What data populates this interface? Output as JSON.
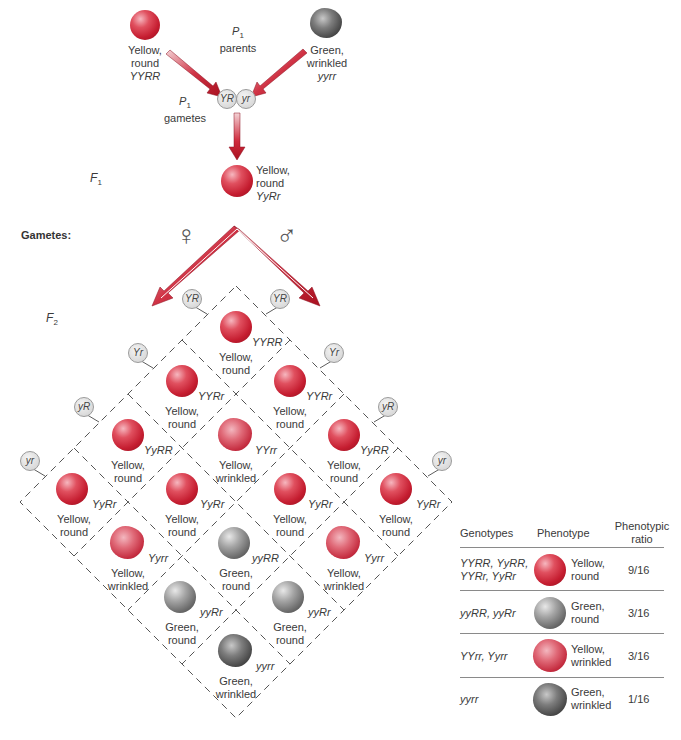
{
  "p1": {
    "title_main": "P",
    "title_sub": "1",
    "title_word": "parents",
    "left_parent": {
      "phenotype_line1": "Yellow,",
      "phenotype_line2": "round",
      "genotype": "YYRR",
      "pea": "yellow-round"
    },
    "right_parent": {
      "phenotype_line1": "Green,",
      "phenotype_line2": "wrinkled",
      "genotype": "yyrr",
      "pea": "green-wrinkled"
    },
    "gametes_label_main": "P",
    "gametes_label_sub": "1",
    "gametes_label_word": "gametes",
    "gametes": [
      "YR",
      "yr"
    ]
  },
  "f1": {
    "label_main": "F",
    "label_sub": "1",
    "phenotype_line1": "Yellow,",
    "phenotype_line2": "round",
    "genotype": "YyRr"
  },
  "gametes_section": {
    "label": "Gametes:",
    "female_symbol": "♀",
    "male_symbol": "♂"
  },
  "f2": {
    "label_main": "F",
    "label_sub": "2",
    "female_gametes": [
      "YR",
      "Yr",
      "yR",
      "yr"
    ],
    "male_gametes": [
      "YR",
      "Yr",
      "yR",
      "yr"
    ],
    "cells": [
      {
        "f": 0,
        "m": 0,
        "genotype": "YYRR",
        "line1": "Yellow,",
        "line2": "round",
        "pea": "yr"
      },
      {
        "f": 1,
        "m": 0,
        "genotype": "YYRr",
        "line1": "Yellow,",
        "line2": "round",
        "pea": "yr"
      },
      {
        "f": 0,
        "m": 1,
        "genotype": "YYRr",
        "line1": "Yellow,",
        "line2": "round",
        "pea": "yr"
      },
      {
        "f": 2,
        "m": 0,
        "genotype": "YyRR",
        "line1": "Yellow,",
        "line2": "round",
        "pea": "yr"
      },
      {
        "f": 1,
        "m": 1,
        "genotype": "YYrr",
        "line1": "Yellow,",
        "line2": "wrinkled",
        "pea": "yw"
      },
      {
        "f": 0,
        "m": 2,
        "genotype": "YyRR",
        "line1": "Yellow,",
        "line2": "round",
        "pea": "yr"
      },
      {
        "f": 3,
        "m": 0,
        "genotype": "YyRr",
        "line1": "Yellow,",
        "line2": "round",
        "pea": "yr"
      },
      {
        "f": 2,
        "m": 1,
        "genotype": "YyRr",
        "line1": "Yellow,",
        "line2": "round",
        "pea": "yr"
      },
      {
        "f": 1,
        "m": 2,
        "genotype": "YyRr",
        "line1": "Yellow,",
        "line2": "round",
        "pea": "yr"
      },
      {
        "f": 0,
        "m": 3,
        "genotype": "YyRr",
        "line1": "Yellow,",
        "line2": "round",
        "pea": "yr"
      },
      {
        "f": 3,
        "m": 1,
        "genotype": "Yyrr",
        "line1": "Yellow,",
        "line2": "wrinkled",
        "pea": "yw"
      },
      {
        "f": 2,
        "m": 2,
        "genotype": "yyRR",
        "line1": "Green,",
        "line2": "round",
        "pea": "gr"
      },
      {
        "f": 1,
        "m": 3,
        "genotype": "Yyrr",
        "line1": "Yellow,",
        "line2": "wrinkled",
        "pea": "yw"
      },
      {
        "f": 3,
        "m": 2,
        "genotype": "yyRr",
        "line1": "Green,",
        "line2": "round",
        "pea": "gr"
      },
      {
        "f": 2,
        "m": 3,
        "genotype": "yyRr",
        "line1": "Green,",
        "line2": "round",
        "pea": "gr"
      },
      {
        "f": 3,
        "m": 3,
        "genotype": "yyrr",
        "line1": "Green,",
        "line2": "wrinkled",
        "pea": "gw"
      }
    ]
  },
  "summary_table": {
    "headers": {
      "genotypes": "Genotypes",
      "phenotype": "Phenotype",
      "ratio_line1": "Phenotypic",
      "ratio_line2": "ratio"
    },
    "rows": [
      {
        "genotypes_line1": "YYRR, YyRR,",
        "genotypes_line2": "YYRr, YyRr",
        "pea": "yr",
        "phenotype_line1": "Yellow,",
        "phenotype_line2": "round",
        "ratio": "9/16"
      },
      {
        "genotypes_line1": "yyRR, yyRr",
        "genotypes_line2": "",
        "pea": "gr",
        "phenotype_line1": "Green,",
        "phenotype_line2": "round",
        "ratio": "3/16"
      },
      {
        "genotypes_line1": "YYrr, Yyrr",
        "genotypes_line2": "",
        "pea": "yw",
        "phenotype_line1": "Yellow,",
        "phenotype_line2": "wrinkled",
        "ratio": "3/16"
      },
      {
        "genotypes_line1": "yyrr",
        "genotypes_line2": "",
        "pea": "gw",
        "phenotype_line1": "Green,",
        "phenotype_line2": "wrinkled",
        "ratio": "1/16"
      }
    ]
  },
  "colors": {
    "arrow_red": "#c0182b",
    "yellow_pea": "#c51d30",
    "green_pea": "#6b6b6b",
    "dashed_line": "#555555",
    "table_rule": "#8a8a8a"
  }
}
